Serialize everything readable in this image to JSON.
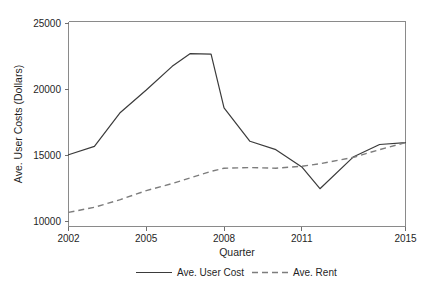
{
  "figure": {
    "background_color": "#ffffff",
    "width": 427,
    "height": 289
  },
  "chart_data": {
    "type": "line",
    "title": "",
    "xlabel": "Quarter",
    "ylabel": "Ave. User Costs (Dollars)",
    "xlim": [
      2002,
      2015
    ],
    "ylim": [
      9400,
      25400
    ],
    "grid": false,
    "legend_position": "bottom-center",
    "xticks": [
      2002,
      2005,
      2008,
      2011,
      2015
    ],
    "xtick_labels": [
      "2002",
      "2005",
      "2008",
      "2011",
      "2015"
    ],
    "yticks": [
      10000,
      15000,
      20000,
      25000
    ],
    "ytick_labels": [
      "10000",
      "15000",
      "20000",
      "25000"
    ],
    "x": [
      2002,
      2003,
      2004,
      2005,
      2006,
      2006.7,
      2007.5,
      2008,
      2009,
      2010,
      2011,
      2011.7,
      2013,
      2014,
      2015
    ],
    "series": [
      {
        "name": "Ave. User Cost",
        "style": "solid",
        "color": "#3b3b3b",
        "values": [
          15000,
          15650,
          18300,
          20050,
          21900,
          22900,
          22850,
          18650,
          16050,
          15400,
          14050,
          12350,
          14850,
          15800,
          15950
        ]
      },
      {
        "name": "Ave. Rent",
        "style": "dashed",
        "color": "#7d7d7d",
        "values": [
          10500,
          10900,
          11500,
          12200,
          12750,
          13200,
          13700,
          13950,
          14000,
          13950,
          14100,
          14300,
          14800,
          15400,
          15950
        ]
      }
    ],
    "legend": [
      {
        "label": "Ave. User Cost",
        "style": "solid",
        "color": "#3b3b3b"
      },
      {
        "label": "Ave. Rent",
        "style": "dashed",
        "color": "#7d7d7d"
      }
    ]
  }
}
